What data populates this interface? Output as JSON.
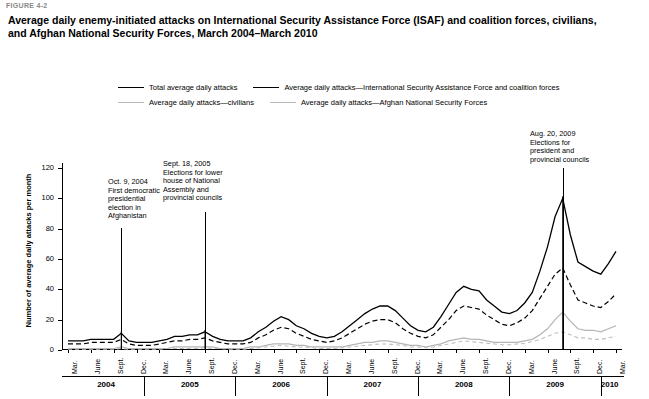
{
  "figure_label": "FIGURE 4-2",
  "title": "Average daily enemy-initiated attacks on International Security Assistance Force (ISAF) and coalition forces, civilians, and Afghan National Security Forces, March 2004–March 2010",
  "legend": [
    {
      "key": "total",
      "label": "Total average daily attacks",
      "style": "solid-dark"
    },
    {
      "key": "isaf",
      "label": "Average daily attacks—International Security Assistance Force and coalition forces",
      "style": "dash-dark"
    },
    {
      "key": "civilians",
      "label": "Average daily attacks—civilians",
      "style": "solid-light"
    },
    {
      "key": "ansf",
      "label": "Average daily attacks—Afghan National Security Forces",
      "style": "dash-light"
    }
  ],
  "annotations": [
    {
      "key": "oct2004",
      "text": "Oct. 9, 2004\nFirst democratic\npresidential\nelection in\nAfghanistan"
    },
    {
      "key": "sept2005",
      "text": "Sept. 18, 2005\nElections for lower\nhouse of National\nAssembly and\nprovincial councils"
    },
    {
      "key": "aug2009",
      "text": "Aug. 20, 2009\nElections for\npresident and\nprovincial councils"
    }
  ],
  "chart_data": {
    "type": "line",
    "title": "Average daily enemy-initiated attacks on International Security Assistance Force (ISAF) and coalition forces, civilians, and Afghan National Security Forces, March 2004–March 2010",
    "xlabel": "",
    "ylabel": "Number of average daily attacks per month",
    "ylim": [
      0,
      120
    ],
    "yticks": [
      0,
      20,
      40,
      60,
      80,
      100,
      120
    ],
    "grid": false,
    "legend_position": "top",
    "x": [
      "Mar. 2004",
      "Apr. 2004",
      "May 2004",
      "June 2004",
      "July 2004",
      "Aug. 2004",
      "Sept. 2004",
      "Oct. 2004",
      "Nov. 2004",
      "Dec. 2004",
      "Jan. 2005",
      "Feb. 2005",
      "Mar. 2005",
      "Apr. 2005",
      "May 2005",
      "June 2005",
      "July 2005",
      "Aug. 2005",
      "Sept. 2005",
      "Oct. 2005",
      "Nov. 2005",
      "Dec. 2005",
      "Jan. 2006",
      "Feb. 2006",
      "Mar. 2006",
      "Apr. 2006",
      "May 2006",
      "June 2006",
      "July 2006",
      "Aug. 2006",
      "Sept. 2006",
      "Oct. 2006",
      "Nov. 2006",
      "Dec. 2006",
      "Jan. 2007",
      "Feb. 2007",
      "Mar. 2007",
      "Apr. 2007",
      "May 2007",
      "June 2007",
      "July 2007",
      "Aug. 2007",
      "Sept. 2007",
      "Oct. 2007",
      "Nov. 2007",
      "Dec. 2007",
      "Jan. 2008",
      "Feb. 2008",
      "Mar. 2008",
      "Apr. 2008",
      "May 2008",
      "June 2008",
      "July 2008",
      "Aug. 2008",
      "Sept. 2008",
      "Oct. 2008",
      "Nov. 2008",
      "Dec. 2008",
      "Jan. 2009",
      "Feb. 2009",
      "Mar. 2009",
      "Apr. 2009",
      "May 2009",
      "June 2009",
      "July 2009",
      "Aug. 2009",
      "Sept. 2009",
      "Oct. 2009",
      "Nov. 2009",
      "Dec. 2009",
      "Jan. 2010",
      "Feb. 2010",
      "Mar. 2010"
    ],
    "x_tick_labels": [
      "Mar.",
      "June",
      "Sept.",
      "Dec.",
      "Mar.",
      "June",
      "Sept.",
      "Dec.",
      "Mar.",
      "June",
      "Sept.",
      "Dec.",
      "Mar.",
      "June",
      "Sept.",
      "Dec.",
      "Mar.",
      "June",
      "Sept.",
      "Dec.",
      "Mar.",
      "June",
      "Sept.",
      "Dec.",
      "Mar."
    ],
    "year_bands": [
      "2004",
      "2005",
      "2006",
      "2007",
      "2008",
      "2009",
      "2010"
    ],
    "series": [
      {
        "name": "Total average daily attacks",
        "style": "solid-dark",
        "values": [
          6,
          6,
          6,
          7,
          7,
          7,
          7,
          11,
          6,
          5,
          5,
          5,
          6,
          7,
          9,
          9,
          10,
          10,
          12,
          9,
          7,
          6,
          6,
          6,
          8,
          12,
          15,
          19,
          22,
          20,
          16,
          14,
          11,
          9,
          8,
          9,
          12,
          16,
          20,
          24,
          27,
          29,
          29,
          26,
          21,
          16,
          13,
          12,
          15,
          22,
          30,
          38,
          42,
          40,
          39,
          33,
          29,
          25,
          24,
          26,
          31,
          38,
          52,
          68,
          88,
          100,
          76,
          58,
          55,
          52,
          50,
          57,
          65
        ]
      },
      {
        "name": "Average daily attacks—International Security Assistance Force and coalition forces",
        "style": "dash-dark",
        "values": [
          4,
          4,
          4,
          5,
          5,
          5,
          5,
          7,
          4,
          3,
          3,
          3,
          4,
          5,
          6,
          6,
          7,
          7,
          8,
          6,
          5,
          4,
          4,
          4,
          5,
          8,
          10,
          13,
          15,
          14,
          11,
          9,
          7,
          6,
          5,
          6,
          8,
          11,
          14,
          17,
          19,
          20,
          20,
          18,
          14,
          11,
          9,
          8,
          10,
          15,
          20,
          26,
          29,
          28,
          27,
          23,
          20,
          17,
          16,
          18,
          21,
          26,
          34,
          42,
          50,
          54,
          43,
          33,
          31,
          29,
          28,
          32,
          37
        ]
      },
      {
        "name": "Average daily attacks—civilians",
        "style": "solid-light",
        "values": [
          1,
          1,
          1,
          1,
          1,
          1,
          1,
          2,
          1,
          1,
          1,
          1,
          1,
          1,
          2,
          2,
          2,
          2,
          2,
          2,
          1,
          1,
          1,
          1,
          2,
          2,
          3,
          4,
          4,
          4,
          3,
          3,
          2,
          2,
          2,
          2,
          2,
          3,
          4,
          5,
          5,
          6,
          6,
          5,
          4,
          3,
          3,
          2,
          3,
          4,
          6,
          7,
          8,
          7,
          7,
          6,
          5,
          5,
          5,
          5,
          6,
          7,
          10,
          14,
          20,
          25,
          19,
          14,
          13,
          13,
          12,
          14,
          16
        ]
      },
      {
        "name": "Average daily attacks—Afghan National Security Forces",
        "style": "dash-light",
        "values": [
          0.5,
          0.5,
          0.5,
          0.5,
          0.5,
          0.5,
          0.5,
          1,
          0.5,
          0.5,
          0.5,
          0.5,
          0.5,
          1,
          1,
          1,
          1,
          1,
          1.5,
          1,
          1,
          0.5,
          0.5,
          0.5,
          1,
          1.5,
          2,
          2.5,
          3,
          2.5,
          2,
          2,
          1.5,
          1,
          1,
          1,
          1.5,
          2,
          2.5,
          3,
          3.5,
          4,
          4,
          3.5,
          3,
          2,
          2,
          1.5,
          2,
          3,
          4,
          5,
          6,
          5.5,
          5,
          4.5,
          4,
          3.5,
          3.5,
          4,
          4.5,
          5.5,
          7,
          9,
          11,
          12,
          10,
          8,
          8,
          7,
          7,
          8,
          9
        ]
      }
    ],
    "event_markers": [
      {
        "label": "Oct. 9, 2004",
        "x": "Oct. 2004"
      },
      {
        "label": "Sept. 18, 2005",
        "x": "Sept. 2005"
      },
      {
        "label": "Aug. 20, 2009",
        "x": "Aug. 2009"
      }
    ]
  }
}
